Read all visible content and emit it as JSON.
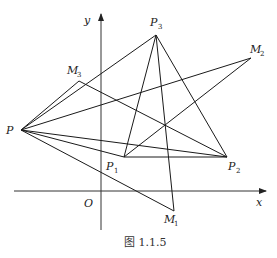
{
  "figure": {
    "caption": "图 1.1.5",
    "axes": {
      "x_label": "x",
      "y_label": "y",
      "origin_label": "O"
    },
    "points": {
      "P": {
        "label": "P",
        "sub": "",
        "x": 21,
        "y": 130
      },
      "P1": {
        "label": "P",
        "sub": "1",
        "x": 124,
        "y": 157
      },
      "P2": {
        "label": "P",
        "sub": "2",
        "x": 227,
        "y": 157
      },
      "P3": {
        "label": "P",
        "sub": "3",
        "x": 156,
        "y": 35
      },
      "M1": {
        "label": "M",
        "sub": "1",
        "x": 174,
        "y": 211
      },
      "M2": {
        "label": "M",
        "sub": "2",
        "x": 251,
        "y": 58
      },
      "M3": {
        "label": "M",
        "sub": "3",
        "x": 79,
        "y": 81
      }
    },
    "segments": [
      [
        "P",
        "P3"
      ],
      [
        "P",
        "M3"
      ],
      [
        "P",
        "M2"
      ],
      [
        "P",
        "P1"
      ],
      [
        "P",
        "P2"
      ],
      [
        "P",
        "M1"
      ],
      [
        "P3",
        "P1"
      ],
      [
        "P3",
        "P2"
      ],
      [
        "P3",
        "M1"
      ],
      [
        "P1",
        "P2"
      ],
      [
        "P1",
        "M2"
      ],
      [
        "M3",
        "P2"
      ]
    ],
    "stroke_color": "#1a1a1a"
  }
}
